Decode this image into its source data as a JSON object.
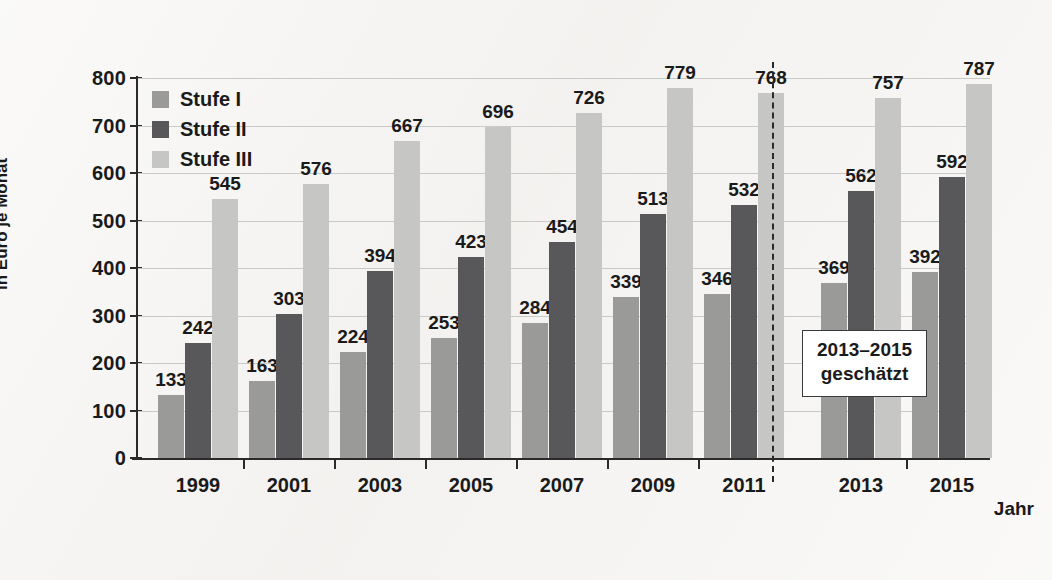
{
  "chart_data": {
    "type": "bar",
    "title": "",
    "xlabel": "Jahr",
    "ylabel": "in Euro je Monat",
    "ylim": [
      0,
      800
    ],
    "ytick_step": 100,
    "yticks": [
      0,
      100,
      200,
      300,
      400,
      500,
      600,
      700,
      800
    ],
    "grid": true,
    "legend_position": "top-left",
    "categories": [
      "1999",
      "2001",
      "2003",
      "2005",
      "2007",
      "2009",
      "2011",
      "2013",
      "2015"
    ],
    "series": [
      {
        "name": "Stufe I",
        "color": "#9a9a98",
        "values": [
          133,
          163,
          224,
          253,
          284,
          339,
          346,
          369,
          392
        ]
      },
      {
        "name": "Stufe II",
        "color": "#58585a",
        "values": [
          242,
          303,
          394,
          423,
          454,
          513,
          532,
          562,
          592
        ]
      },
      {
        "name": "Stufe III",
        "color": "#c6c6c4",
        "values": [
          545,
          576,
          667,
          696,
          726,
          779,
          768,
          757,
          787
        ]
      }
    ],
    "annotations": [
      {
        "name": "forecast-note",
        "lines": [
          "2013–2015",
          "geschätzt"
        ],
        "after_category": "2011"
      }
    ],
    "forecast_divider_after": "2011"
  }
}
